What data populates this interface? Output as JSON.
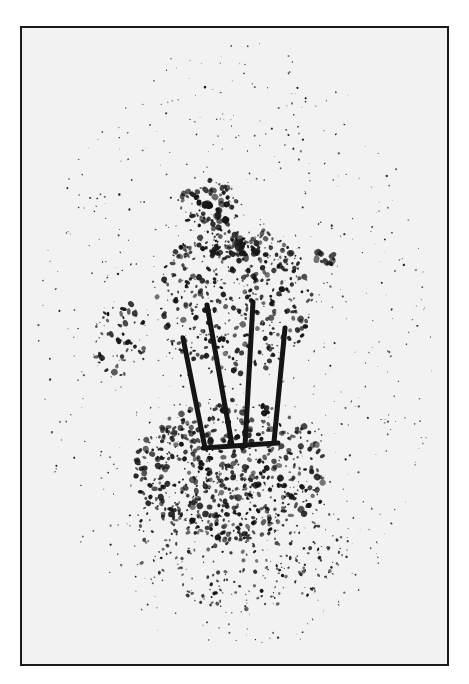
{
  "figure": {
    "frame": {
      "x": 20,
      "y": 26,
      "width": 429,
      "height": 640,
      "border_color": "#1a1a1a",
      "background": "#f2f2f2"
    },
    "ink_color": "#141414",
    "rods": [
      {
        "x1": 183,
        "y1": 338,
        "x2": 205,
        "y2": 448,
        "width": 5
      },
      {
        "x1": 207,
        "y1": 305,
        "x2": 232,
        "y2": 445,
        "width": 5
      },
      {
        "x1": 253,
        "y1": 302,
        "x2": 245,
        "y2": 446,
        "width": 5
      },
      {
        "x1": 285,
        "y1": 328,
        "x2": 274,
        "y2": 442,
        "width": 5
      }
    ],
    "base": {
      "x1": 203,
      "y1": 448,
      "x2": 278,
      "y2": 443,
      "width": 5
    },
    "clusters": [
      {
        "cx": 235,
        "cy": 300,
        "rx": 80,
        "ry": 75,
        "count": 420,
        "size": 2.2
      },
      {
        "cx": 230,
        "cy": 470,
        "rx": 95,
        "ry": 70,
        "count": 520,
        "size": 2.4
      },
      {
        "cx": 240,
        "cy": 540,
        "rx": 110,
        "ry": 70,
        "count": 300,
        "size": 1.6
      },
      {
        "cx": 210,
        "cy": 205,
        "rx": 30,
        "ry": 25,
        "count": 60,
        "size": 2.8
      },
      {
        "cx": 235,
        "cy": 250,
        "rx": 25,
        "ry": 12,
        "count": 40,
        "size": 3
      },
      {
        "cx": 120,
        "cy": 340,
        "rx": 28,
        "ry": 40,
        "count": 50,
        "size": 2.6
      },
      {
        "cx": 325,
        "cy": 258,
        "rx": 12,
        "ry": 8,
        "count": 12,
        "size": 3
      },
      {
        "cx": 235,
        "cy": 350,
        "rx": 200,
        "ry": 310,
        "count": 700,
        "size": 0.9
      }
    ]
  }
}
